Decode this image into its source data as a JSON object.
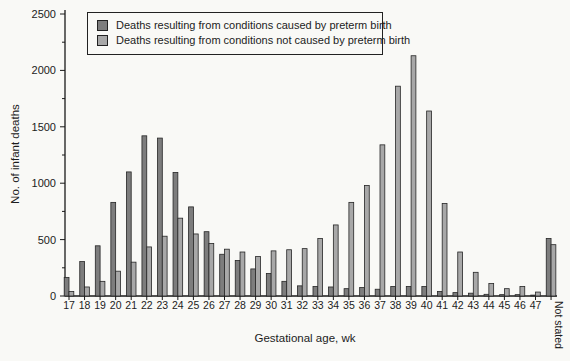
{
  "figure": {
    "background_color": "#f9f9f6",
    "text_color": "#1c1c1c"
  },
  "legend": {
    "items": [
      {
        "label": "Deaths resulting from conditions caused by preterm birth",
        "color": "#7d7d7d"
      },
      {
        "label": "Deaths resulting from conditions not caused by preterm birth",
        "color": "#a8a8a8"
      }
    ]
  },
  "chart_data": {
    "type": "bar",
    "xlabel": "Gestational age, wk",
    "ylabel": "No. of infant deaths",
    "ylim": [
      0,
      2500
    ],
    "yticks": [
      0,
      500,
      1000,
      1500,
      2000,
      2500
    ],
    "ytick_minor_step": 250,
    "grid": false,
    "legend_position": "top-left-inside",
    "categories": [
      "17",
      "18",
      "19",
      "20",
      "21",
      "22",
      "23",
      "24",
      "25",
      "26",
      "27",
      "28",
      "29",
      "30",
      "31",
      "32",
      "33",
      "34",
      "35",
      "36",
      "37",
      "38",
      "39",
      "40",
      "41",
      "42",
      "43",
      "44",
      "45",
      "46",
      "47",
      "Not stated"
    ],
    "series": [
      {
        "name": "Deaths resulting from conditions caused by preterm birth",
        "color": "#7d7d7d",
        "values": [
          165,
          305,
          445,
          830,
          1100,
          1420,
          1400,
          1095,
          790,
          570,
          370,
          315,
          240,
          200,
          130,
          90,
          85,
          80,
          65,
          75,
          60,
          85,
          85,
          85,
          40,
          30,
          25,
          15,
          12,
          12,
          8,
          510
        ]
      },
      {
        "name": "Deaths resulting from conditions not caused by preterm birth",
        "color": "#a8a8a8",
        "values": [
          40,
          80,
          130,
          220,
          300,
          435,
          530,
          690,
          550,
          465,
          415,
          390,
          350,
          400,
          410,
          420,
          510,
          630,
          830,
          980,
          1340,
          1860,
          2130,
          1640,
          820,
          390,
          210,
          110,
          65,
          85,
          35,
          455
        ]
      }
    ]
  }
}
